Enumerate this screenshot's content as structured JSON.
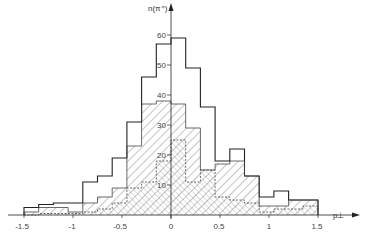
{
  "chart_data": {
    "type": "bar",
    "title": "",
    "xlabel": "p⊥",
    "ylabel": "n(π⁺)",
    "bin_edges": [
      -1.5,
      -1.35,
      -1.2,
      -1.05,
      -0.9,
      -0.75,
      -0.6,
      -0.45,
      -0.3,
      -0.15,
      0,
      0.15,
      0.3,
      0.45,
      0.6,
      0.75,
      0.9,
      1.05,
      1.2,
      1.35,
      1.5
    ],
    "series": [
      {
        "name": "total (open histogram)",
        "style": "solid",
        "values": [
          2.5,
          3.5,
          4,
          4,
          11,
          13,
          19,
          31,
          46,
          57,
          59,
          49,
          36,
          18,
          22,
          13,
          6,
          8,
          5,
          5
        ]
      },
      {
        "name": "subset (wide hatch)",
        "style": "hatch-backslash",
        "values": [
          1,
          2.5,
          2.5,
          1,
          4,
          6,
          9,
          23,
          37,
          38,
          37,
          29,
          15,
          17,
          18,
          13,
          3,
          3,
          5,
          5
        ]
      },
      {
        "name": "subset (fine hatch)",
        "style": "hatch-slash",
        "values": [
          0,
          0.5,
          0.5,
          0.5,
          1,
          2,
          4,
          9,
          11,
          18,
          25,
          11,
          15,
          6,
          5,
          4,
          1,
          2,
          2,
          3
        ]
      }
    ],
    "x_ticks": [
      "-1.5",
      "-1",
      "-0.5",
      "0",
      "0.5",
      "1",
      "1.5"
    ],
    "y_ticks": [
      "10",
      "20",
      "30",
      "40",
      "50",
      "60"
    ],
    "xlim": [
      -1.5,
      1.55
    ],
    "ylim": [
      0,
      65
    ],
    "grid": false,
    "legend": "none"
  },
  "axes": {
    "x_label": "p⊥",
    "y_label": "n(π⁺)"
  }
}
